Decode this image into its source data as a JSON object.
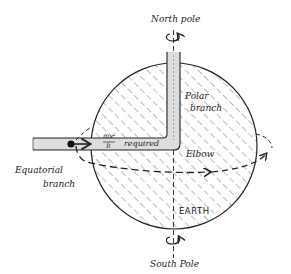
{
  "diagram": {
    "labels": {
      "north_pole": "North pole",
      "south_pole": "South Pole",
      "polar_branch_1": "Polar",
      "polar_branch_2": "branch",
      "equatorial_branch_1": "Equatorial",
      "equatorial_branch_2": "branch",
      "elbow": "Elbow",
      "earth": "EARTH",
      "force_numerator": "mv²",
      "force_denominator": "R",
      "force_suffix": "required"
    },
    "colors": {
      "ink": "#222222",
      "pipe_fill": "#d9d9d9",
      "background": "#ffffff"
    },
    "icons": [
      "rotation-arrow-north-icon",
      "rotation-arrow-south-icon",
      "mass-dot-icon",
      "force-arrow-icon"
    ]
  }
}
